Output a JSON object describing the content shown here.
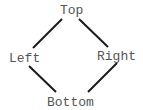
{
  "diagram": {
    "type": "diamond-graph",
    "nodes": [
      {
        "id": "top",
        "label": "Top",
        "x": 60,
        "y": 3
      },
      {
        "id": "left",
        "label": "Left",
        "x": 9,
        "y": 51
      },
      {
        "id": "right",
        "label": "Right",
        "x": 97,
        "y": 49
      },
      {
        "id": "bottom",
        "label": "Bottom",
        "x": 47,
        "y": 95
      }
    ],
    "edges": [
      {
        "from": "top",
        "to": "left"
      },
      {
        "from": "top",
        "to": "right"
      },
      {
        "from": "left",
        "to": "bottom"
      },
      {
        "from": "right",
        "to": "bottom"
      }
    ],
    "colors": {
      "edge": "#1a1a1a",
      "label": "#555555",
      "background": "#ffffff"
    }
  }
}
